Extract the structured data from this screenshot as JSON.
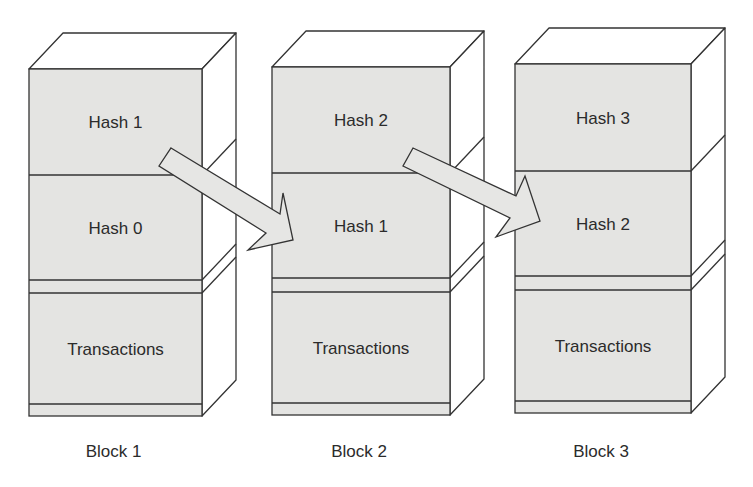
{
  "diagram": {
    "type": "blockchain-hash-chain",
    "colors": {
      "block_fill": "#e4e4e2",
      "side_fill": "#ffffff",
      "stroke": "#333333",
      "text": "#2b2b2b",
      "arrow_fill": "#e6e6e4"
    },
    "blocks": [
      {
        "caption": "Block 1",
        "top_hash": "Hash 1",
        "prev_hash": "Hash 0",
        "body": "Transactions",
        "geom": {
          "x0": 29,
          "x1": 202,
          "top": 69,
          "div": 175,
          "b1": 280,
          "b2": 293,
          "b3": 404,
          "bottom": 416,
          "dx": 34,
          "dy": 36
        }
      },
      {
        "caption": "Block 2",
        "top_hash": "Hash 2",
        "prev_hash": "Hash 1",
        "body": "Transactions",
        "geom": {
          "x0": 272,
          "x1": 450,
          "top": 67,
          "div": 173,
          "b1": 278,
          "b2": 292,
          "b3": 403,
          "bottom": 415,
          "dx": 34,
          "dy": 36
        }
      },
      {
        "caption": "Block 3",
        "top_hash": "Hash 3",
        "prev_hash": "Hash 2",
        "body": "Transactions",
        "geom": {
          "x0": 515,
          "x1": 691,
          "top": 64,
          "div": 171,
          "b1": 276,
          "b2": 290,
          "b3": 401,
          "bottom": 413,
          "dx": 34,
          "dy": 36
        }
      }
    ],
    "arrows": [
      {
        "from": "Block 1 Hash 1",
        "to": "Block 2 Hash 1",
        "points": "171,148 280,214 283,193 293,240 248,250 266,233 159,166"
      },
      {
        "from": "Block 2 Hash 2",
        "to": "Block 3 Hash 2",
        "points": "413,148 516,196 525,176 540,221 496,237 510,218 403,166"
      }
    ]
  }
}
